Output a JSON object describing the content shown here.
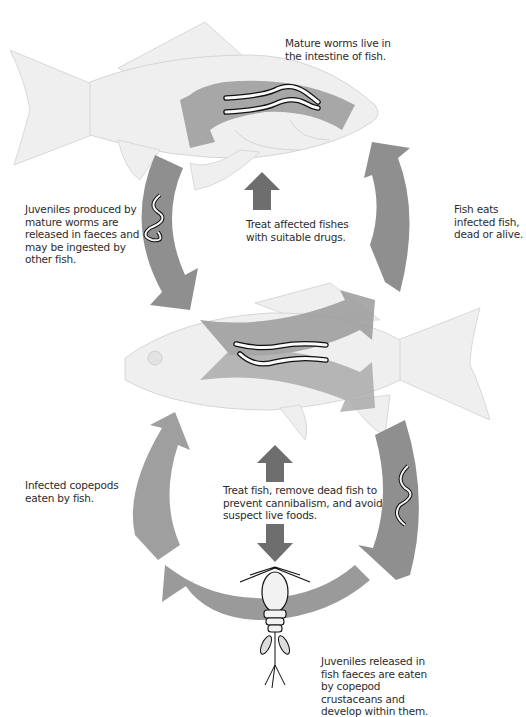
{
  "diagram": {
    "type": "life-cycle",
    "colors": {
      "background": "#ffffff",
      "fish_fill": "#efefef",
      "fish_outline": "#d6d6d6",
      "arrow": "#8c8c8c",
      "arrow_light": "#b8b8b8",
      "treatment_arrow": "#6e6e6e",
      "text": "#2c2c2c"
    },
    "labels": {
      "mature_worms": [
        "Mature worms live in",
        "the intestine of fish."
      ],
      "juveniles_produced": [
        "Juveniles produced by",
        "mature worms are",
        "released in faeces and",
        "may be ingested by",
        "other fish."
      ],
      "treat_affected": [
        "Treat affected fishes",
        "with suitable drugs."
      ],
      "fish_eats": [
        "Fish eats",
        "infected fish,",
        "dead or alive."
      ],
      "infected_copepods": [
        "Infected copepods",
        "eaten by fish."
      ],
      "treat_remove": [
        "Treat fish, remove dead fish to",
        "prevent cannibalism, and avoid",
        "suspect live foods."
      ],
      "juveniles_released": [
        "Juveniles released in",
        "fish faeces are eaten",
        "by copepod",
        "crustaceans and",
        "develop within them."
      ]
    },
    "nodes": [
      {
        "id": "fish-top",
        "label": "Adult fish with mature worms"
      },
      {
        "id": "fish-middle",
        "label": "Infected fish with worms"
      },
      {
        "id": "copepod",
        "label": "Copepod crustacean (intermediate host)"
      }
    ],
    "edges": [
      {
        "from": "fish-top",
        "to": "fish-middle",
        "label": "Juveniles released in faeces, ingested by other fish"
      },
      {
        "from": "fish-middle",
        "to": "fish-top",
        "label": "Fish eats infected fish, dead or alive"
      },
      {
        "from": "fish-middle",
        "to": "copepod",
        "label": "Juveniles released in fish faeces eaten by copepods"
      },
      {
        "from": "copepod",
        "to": "fish-middle",
        "label": "Infected copepods eaten by fish"
      }
    ]
  }
}
